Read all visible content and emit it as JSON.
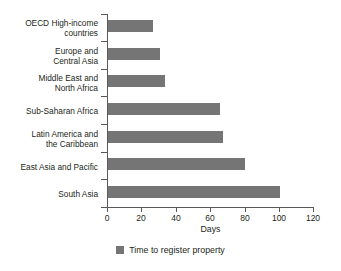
{
  "chart_data": {
    "type": "bar",
    "orientation": "horizontal",
    "title": "",
    "xlabel": "Days",
    "ylabel": "",
    "xlim": [
      0,
      120
    ],
    "xticks": [
      0,
      20,
      40,
      60,
      80,
      100,
      120
    ],
    "grid": false,
    "legend_position": "bottom",
    "categories": [
      "OECD High-income countries",
      "Europe and Central Asia",
      "Middle East and North Africa",
      "Sub-Saharan Africa",
      "Latin America and the Caribbean",
      "East Asia and Pacific",
      "South Asia"
    ],
    "category_lines": [
      [
        "OECD High-income",
        "countries"
      ],
      [
        "Europe and",
        "Central Asia"
      ],
      [
        "Middle East and",
        "North Africa"
      ],
      [
        "Sub-Saharan Africa"
      ],
      [
        "Latin America and",
        "the Caribbean"
      ],
      [
        "East Asia and Pacific"
      ],
      [
        "South Asia"
      ]
    ],
    "series": [
      {
        "name": "Time to register property",
        "color": "#757575",
        "values": [
          26,
          30,
          33,
          65,
          67,
          80,
          100
        ]
      }
    ]
  },
  "legend": {
    "items": [
      {
        "label": "Time to register property",
        "color": "#757575"
      }
    ]
  },
  "axis": {
    "x_title": "Days",
    "tick_labels": [
      "0",
      "20",
      "40",
      "60",
      "80",
      "100",
      "120"
    ]
  },
  "colors": {
    "bar": "#757575",
    "axis": "#58595b",
    "text": "#231f20",
    "background": "#ffffff"
  }
}
